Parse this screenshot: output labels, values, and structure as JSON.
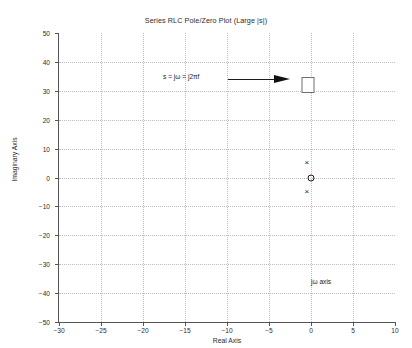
{
  "chart_data": {
    "type": "scatter",
    "title": "Series RLC Pole/Zero Plot (Large |s|)",
    "xlabel": "Real Axis",
    "ylabel": "Imaginary Axis",
    "xlim": [
      -30,
      10
    ],
    "ylim": [
      -50,
      50
    ],
    "xticks": [
      -30,
      -25,
      -20,
      -15,
      -10,
      -5,
      0,
      5,
      10
    ],
    "yticks": [
      -50,
      -40,
      -30,
      -20,
      -10,
      0,
      10,
      20,
      30,
      40,
      50
    ],
    "grid": "dotted",
    "legend": "none",
    "series": [
      {
        "name": "poles",
        "marker": "x",
        "points": [
          {
            "real": -0.5,
            "imag": 5.0
          },
          {
            "real": -0.5,
            "imag": -5.0
          }
        ]
      },
      {
        "name": "zeros",
        "marker": "o",
        "points": [
          {
            "real": 0.0,
            "imag": 0.0
          }
        ]
      },
      {
        "name": "evaluation-point",
        "marker": "square",
        "points": [
          {
            "real": -0.3,
            "imag": 32.0
          }
        ]
      }
    ],
    "annotations": [
      {
        "name": "s-definition",
        "text": "s = jω = j2πf",
        "real": -22.3,
        "imag": 34.4
      },
      {
        "name": "jw-axis-label",
        "text": "jω axis",
        "real": 0.4,
        "imag": -34.5
      },
      {
        "name": "arrow",
        "text": "",
        "from_real": -9.5,
        "to_real": -1.9,
        "imag": 32.0
      }
    ]
  }
}
